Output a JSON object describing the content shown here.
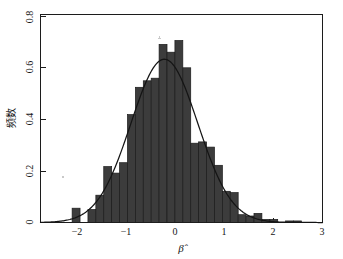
{
  "chart_data": {
    "type": "bar",
    "title": "",
    "subtitle": "",
    "xlabel": "β̂",
    "ylabel": "频数",
    "xlim": [
      -2.35,
      3.0
    ],
    "ylim": [
      0,
      0.8
    ],
    "grid": false,
    "legend": null,
    "xticks": [
      -2,
      -1,
      0,
      1,
      2,
      3
    ],
    "xtick_labels": [
      "−2",
      "−1",
      "0",
      "1",
      "2",
      "3"
    ],
    "yticks": [
      0,
      0.2,
      0.4,
      0.6,
      0.8
    ],
    "ytick_labels": [
      "0",
      "0.2",
      "0.4",
      "0.6",
      "0.8"
    ],
    "bin_width": 0.15,
    "bin_starts": [
      -1.9,
      -1.75,
      -1.6,
      -1.45,
      -1.3,
      -1.15,
      -1.0,
      -0.85,
      -0.7,
      -0.55,
      -0.4,
      -0.25,
      -0.1,
      0.05,
      0.2,
      0.35,
      0.5,
      0.65,
      0.8,
      0.95,
      1.1,
      1.25,
      1.4,
      1.55,
      1.7,
      1.85,
      2.0,
      2.15,
      2.3,
      2.45
    ],
    "categories": [
      "-1.90",
      "-1.75",
      "-1.60",
      "-1.45",
      "-1.30",
      "-1.15",
      "-1.00",
      "-0.85",
      "-0.70",
      "-0.55",
      "-0.40",
      "-0.25",
      "-0.10",
      "0.05",
      "0.20",
      "0.35",
      "0.50",
      "0.65",
      "0.80",
      "0.95",
      "1.10",
      "1.25",
      "1.40",
      "1.55",
      "1.70",
      "1.85",
      "2.00",
      "2.15",
      "2.30",
      "2.45"
    ],
    "values": [
      0.0,
      0.055,
      0.0,
      0.05,
      0.105,
      0.215,
      0.19,
      0.23,
      0.415,
      0.52,
      0.545,
      0.555,
      0.685,
      0.655,
      0.7,
      0.595,
      0.305,
      0.31,
      0.29,
      0.22,
      0.12,
      0.115,
      0.03,
      0.025,
      0.035,
      0.012,
      0.012,
      0.0,
      0.006,
      0.006
    ],
    "series": [
      {
        "name": "histogram",
        "type": "bar",
        "values": [
          0.0,
          0.055,
          0.0,
          0.05,
          0.105,
          0.215,
          0.19,
          0.23,
          0.415,
          0.52,
          0.545,
          0.555,
          0.685,
          0.655,
          0.7,
          0.595,
          0.305,
          0.31,
          0.29,
          0.22,
          0.12,
          0.115,
          0.03,
          0.025,
          0.035,
          0.012,
          0.012,
          0.0,
          0.006,
          0.006
        ]
      },
      {
        "name": "normal-density",
        "type": "line",
        "mean": 0.0,
        "sd": 0.635,
        "peak": 0.628,
        "x": [
          -2.3,
          -2.1,
          -1.9,
          -1.7,
          -1.5,
          -1.3,
          -1.1,
          -0.9,
          -0.7,
          -0.5,
          -0.3,
          -0.1,
          0.0,
          0.1,
          0.3,
          0.5,
          0.7,
          0.9,
          1.1,
          1.3,
          1.5,
          1.7,
          1.9,
          2.1,
          2.3,
          2.5,
          2.7
        ],
        "y": [
          0.0009,
          0.0031,
          0.0092,
          0.0236,
          0.0525,
          0.1012,
          0.1692,
          0.2456,
          0.3094,
          0.3386,
          0.3218,
          0.2651,
          0.628,
          0.2651,
          0.3218,
          0.3386,
          0.3094,
          0.2456,
          0.1692,
          0.1012,
          0.0525,
          0.0236,
          0.0092,
          0.0031,
          0.0009,
          0.0002,
          0.0001
        ]
      }
    ],
    "annotations": []
  },
  "axes": {
    "xlabel": "β̂",
    "ylabel": "频数",
    "xtick_labels": [
      "−2",
      "−1",
      "0",
      "1",
      "2",
      "3"
    ],
    "ytick_labels": [
      "0",
      "0.2",
      "0.4",
      "0.6",
      "0.8"
    ]
  },
  "colors": {
    "bar_fill": "#3c3c3c",
    "bar_stroke": "#1b1b1b",
    "curve": "#141414",
    "axis": "#1c1c1c",
    "background": "#ffffff"
  }
}
